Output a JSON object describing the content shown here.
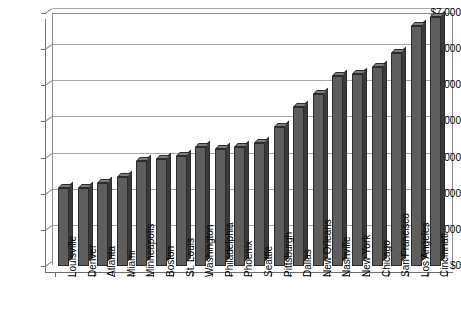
{
  "chart_data": {
    "type": "bar",
    "title": "",
    "subtitle": "",
    "xlabel": "",
    "ylabel": "",
    "ylim": [
      0,
      7000
    ],
    "ytick_step": 1000,
    "grid": true,
    "legend": "none",
    "orientation": "vertical",
    "style": "3d-column",
    "bar_color": "#5e5e5e",
    "bar_side_color": "#3a3a3a",
    "bar_top_color": "#7d7d7d",
    "bar_outline_color": "#2b2b2b",
    "gridline_color": "#a8a8a8",
    "axis_color": "#6e6e6e",
    "plot_background": "#ffffff",
    "currency_prefix": "$",
    "ytick_labels": [
      "$7,000",
      "$6,000",
      "$5,000",
      "$4,000",
      "$3,000",
      "$2,000",
      "$1,000",
      "$0"
    ],
    "ytick_values": [
      7000,
      6000,
      5000,
      4000,
      3000,
      2000,
      1000,
      0
    ],
    "categories": [
      "Louisville",
      "Denver",
      "Atlanta",
      "Miami",
      "Minneapolis",
      "Boston",
      "St. Louis",
      "Washington",
      "Philadelphia",
      "Phoenix",
      "Seattle",
      "Pittsburgh",
      "Dallas",
      "New Orleans",
      "Nashville",
      "New York",
      "Chicago",
      "San Francisco",
      "Los Angeles",
      "Cincinnati"
    ],
    "values": [
      2150,
      2150,
      2300,
      2450,
      2900,
      2950,
      3050,
      3300,
      3250,
      3300,
      3400,
      3850,
      4400,
      4750,
      5250,
      5300,
      5500,
      5900,
      6650,
      6900
    ]
  }
}
